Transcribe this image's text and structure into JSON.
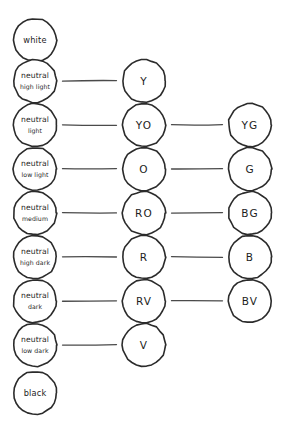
{
  "diagram": {
    "background_color": "#ffffff",
    "stroke_color": "#2b2b2b",
    "connector_color": "#4a4a4a",
    "text_color": "#1d1d1d",
    "columns": [
      {
        "key": "neutral",
        "name": "neutral-value-column",
        "cx": 35
      },
      {
        "key": "hue_primary",
        "name": "primary-hue-column",
        "cx": 144
      },
      {
        "key": "hue_secondary",
        "name": "secondary-hue-column",
        "cx": 250
      }
    ],
    "circle_radius": 21.5,
    "rows": [
      {
        "index": 0,
        "cy": 40,
        "neutral": {
          "line1": "white",
          "line2": "",
          "style": "endpoint"
        },
        "hue_primary": null,
        "hue_secondary": null,
        "connector_left": false,
        "connector_right": false
      },
      {
        "index": 1,
        "cy": 81,
        "neutral": {
          "line1": "neutral",
          "line2": "high light",
          "style": "two-line"
        },
        "hue_primary": "Y",
        "hue_secondary": null,
        "connector_left": true,
        "connector_right": false
      },
      {
        "index": 2,
        "cy": 125,
        "neutral": {
          "line1": "neutral",
          "line2": "light",
          "style": "two-line"
        },
        "hue_primary": "YO",
        "hue_secondary": "YG",
        "connector_left": true,
        "connector_right": true
      },
      {
        "index": 3,
        "cy": 169,
        "neutral": {
          "line1": "neutral",
          "line2": "low light",
          "style": "two-line"
        },
        "hue_primary": "O",
        "hue_secondary": "G",
        "connector_left": true,
        "connector_right": true
      },
      {
        "index": 4,
        "cy": 213,
        "neutral": {
          "line1": "neutral",
          "line2": "medium",
          "style": "two-line"
        },
        "hue_primary": "RO",
        "hue_secondary": "BG",
        "connector_left": true,
        "connector_right": true
      },
      {
        "index": 5,
        "cy": 257,
        "neutral": {
          "line1": "neutral",
          "line2": "high dark",
          "style": "two-line"
        },
        "hue_primary": "R",
        "hue_secondary": "B",
        "connector_left": true,
        "connector_right": true
      },
      {
        "index": 6,
        "cy": 301,
        "neutral": {
          "line1": "neutral",
          "line2": "dark",
          "style": "two-line"
        },
        "hue_primary": "RV",
        "hue_secondary": "BV",
        "connector_left": true,
        "connector_right": true
      },
      {
        "index": 7,
        "cy": 345,
        "neutral": {
          "line1": "neutral",
          "line2": "low dark",
          "style": "two-line"
        },
        "hue_primary": "V",
        "hue_secondary": null,
        "connector_left": true,
        "connector_right": false
      },
      {
        "index": 8,
        "cy": 393,
        "neutral": {
          "line1": "black",
          "line2": "",
          "style": "endpoint"
        },
        "hue_primary": null,
        "hue_secondary": null,
        "connector_left": false,
        "connector_right": false
      }
    ]
  }
}
